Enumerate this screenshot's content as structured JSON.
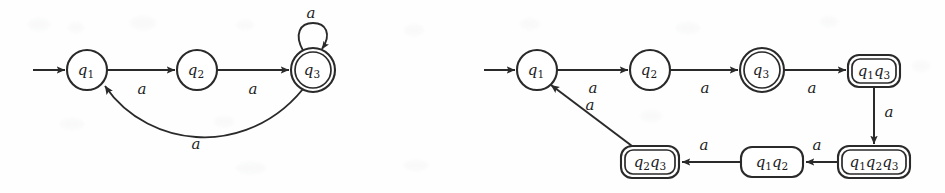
{
  "figure": {
    "background_color": "#fefefe",
    "ink_color": "#2a2a2a",
    "alphabet_symbol": "a"
  },
  "diagrams": [
    {
      "id": "nfa-left",
      "name": "nondeterministic-finite-automaton",
      "start_state": "q1",
      "states": [
        {
          "id": "q1",
          "label_base": "q",
          "label_sub": "1",
          "accepting": false,
          "shape": "circle",
          "cx": 87,
          "cy": 70,
          "r": 20
        },
        {
          "id": "q2",
          "label_base": "q",
          "label_sub": "2",
          "accepting": false,
          "shape": "circle",
          "cx": 197,
          "cy": 70,
          "r": 20
        },
        {
          "id": "q3",
          "label_base": "q",
          "label_sub": "3",
          "accepting": true,
          "shape": "circle",
          "cx": 313,
          "cy": 70,
          "r": 22
        }
      ],
      "transitions": [
        {
          "from": "start",
          "to": "q1",
          "symbol": "",
          "kind": "start-arrow"
        },
        {
          "from": "q1",
          "to": "q2",
          "symbol": "a",
          "kind": "straight",
          "label_x": 142,
          "label_y": 90
        },
        {
          "from": "q2",
          "to": "q3",
          "symbol": "a",
          "kind": "straight",
          "label_x": 253,
          "label_y": 90
        },
        {
          "from": "q3",
          "to": "q3",
          "symbol": "a",
          "kind": "self-loop",
          "label_x": 311,
          "label_y": 14
        },
        {
          "from": "q3",
          "to": "q1",
          "symbol": "a",
          "kind": "curve-below",
          "label_x": 196,
          "label_y": 144
        }
      ]
    },
    {
      "id": "dfa-right",
      "name": "determinized-finite-automaton",
      "start_state": "q1",
      "states": [
        {
          "id": "q1",
          "label_base": "q",
          "label_sub": "1",
          "accepting": false,
          "shape": "circle",
          "cx": 65,
          "cy": 70,
          "r": 20
        },
        {
          "id": "q2",
          "label_base": "q",
          "label_sub": "2",
          "accepting": false,
          "shape": "circle",
          "cx": 178,
          "cy": 70,
          "r": 20
        },
        {
          "id": "q3",
          "label_base": "q",
          "label_sub": "3",
          "accepting": true,
          "shape": "circle",
          "cx": 290,
          "cy": 70,
          "r": 22
        },
        {
          "id": "q1q3",
          "label_parts": [
            [
              "q",
              "1"
            ],
            [
              "q",
              "3"
            ]
          ],
          "accepting": true,
          "shape": "rounded-rect",
          "cx": 402,
          "cy": 71,
          "w": 52,
          "h": 32
        },
        {
          "id": "q1q2q3",
          "label_parts": [
            [
              "q",
              "1"
            ],
            [
              "q",
              "2"
            ],
            [
              "q",
              "3"
            ]
          ],
          "accepting": true,
          "shape": "rounded-rect",
          "cx": 402,
          "cy": 161,
          "w": 72,
          "h": 32
        },
        {
          "id": "q1q2",
          "label_parts": [
            [
              "q",
              "1"
            ],
            [
              "q",
              "2"
            ]
          ],
          "accepting": false,
          "shape": "rounded-rect",
          "cx": 300,
          "cy": 162,
          "w": 62,
          "h": 30
        },
        {
          "id": "q2q3",
          "label_parts": [
            [
              "q",
              "2"
            ],
            [
              "q",
              "3"
            ]
          ],
          "accepting": true,
          "shape": "rounded-rect",
          "cx": 178,
          "cy": 161,
          "w": 58,
          "h": 32
        }
      ],
      "transitions": [
        {
          "from": "start",
          "to": "q1",
          "symbol": "",
          "kind": "start-arrow"
        },
        {
          "from": "q1",
          "to": "q2",
          "symbol": "a",
          "kind": "straight",
          "label_x": 121,
          "label_y": 89
        },
        {
          "from": "q2",
          "to": "q3",
          "symbol": "a",
          "kind": "straight",
          "label_x": 233,
          "label_y": 89
        },
        {
          "from": "q3",
          "to": "q1q3",
          "symbol": "a",
          "kind": "straight",
          "label_x": 340,
          "label_y": 89
        },
        {
          "from": "q1q3",
          "to": "q1q2q3",
          "symbol": "a",
          "kind": "vertical",
          "label_x": 416,
          "label_y": 113
        },
        {
          "from": "q1q2q3",
          "to": "q1q2",
          "symbol": "a",
          "kind": "straight",
          "label_x": 344,
          "label_y": 146
        },
        {
          "from": "q1q2",
          "to": "q2q3",
          "symbol": "a",
          "kind": "straight",
          "label_x": 232,
          "label_y": 146
        },
        {
          "from": "q2q3",
          "to": "q1",
          "symbol": "a",
          "kind": "diagonal",
          "label_x": 118,
          "label_y": 106
        }
      ]
    }
  ]
}
